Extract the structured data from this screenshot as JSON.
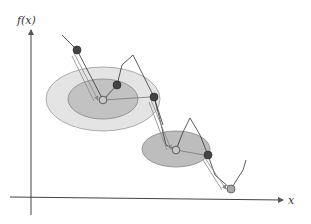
{
  "diagram": {
    "type": "optimization-trajectory",
    "axes": {
      "y_label": "f(x)",
      "x_label": "x"
    },
    "colors": {
      "outer_region": "#e4e4e4",
      "inner_region": "#c2c2c2",
      "region_stroke": "#888888",
      "dark_node": "#444444",
      "light_node": "#b8b8b8",
      "curve": "#333333",
      "arrow": "#777777"
    },
    "regions": [
      {
        "id": "region-1-outer",
        "cx": 103,
        "cy": 99,
        "rx": 57,
        "ry": 32,
        "shade": "light"
      },
      {
        "id": "region-1-inner",
        "cx": 103,
        "cy": 99,
        "rx": 35,
        "ry": 20,
        "shade": "dark"
      },
      {
        "id": "region-2",
        "cx": 176,
        "cy": 149,
        "rx": 34,
        "ry": 18,
        "shade": "dark"
      }
    ],
    "nodes": [
      {
        "id": "n1",
        "x": 77,
        "y": 50,
        "kind": "dark"
      },
      {
        "id": "n2",
        "x": 103,
        "y": 100,
        "kind": "light"
      },
      {
        "id": "n3",
        "x": 117,
        "y": 85,
        "kind": "dark"
      },
      {
        "id": "n4",
        "x": 154,
        "y": 97,
        "kind": "dark"
      },
      {
        "id": "n5",
        "x": 176,
        "y": 150,
        "kind": "light"
      },
      {
        "id": "n6",
        "x": 208,
        "y": 155,
        "kind": "dark"
      },
      {
        "id": "n7",
        "x": 231,
        "y": 189,
        "kind": "light"
      }
    ]
  }
}
